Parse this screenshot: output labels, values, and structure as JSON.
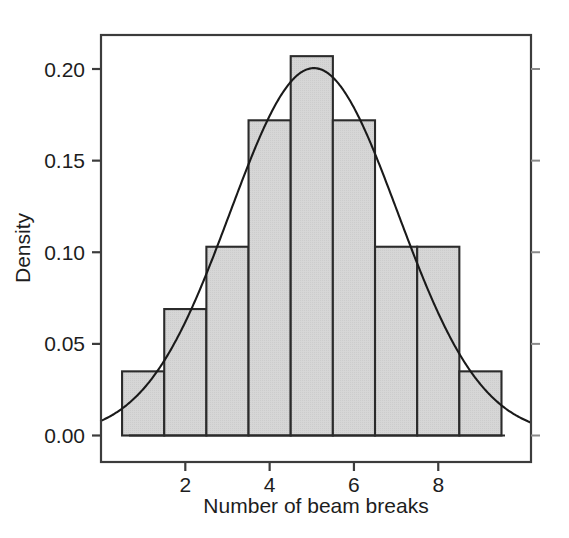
{
  "chart_data": {
    "type": "bar",
    "title": "",
    "subtitle": "",
    "xlabel": "Number of beam breaks",
    "ylabel": "Density",
    "grid": false,
    "legend": "none",
    "xlim": [
      0.0,
      10.2
    ],
    "ylim": [
      0.0,
      0.2175
    ],
    "xticks": [
      2,
      4,
      6,
      8
    ],
    "xtick_labels": [
      "2",
      "4",
      "6",
      "8"
    ],
    "yticks": [
      0.0,
      0.05,
      0.1,
      0.15,
      0.2
    ],
    "ytick_labels": [
      "0.00",
      "0.05",
      "0.10",
      "0.15",
      "0.20"
    ],
    "bin_edges": [
      0.5,
      1.5,
      2.5,
      3.5,
      4.5,
      5.5,
      6.5,
      7.5,
      8.5,
      9.5
    ],
    "bin_centers": [
      1,
      2,
      3,
      4,
      5,
      6,
      7,
      8,
      9
    ],
    "categories": [
      "0.5-1.5",
      "1.5-2.5",
      "2.5-3.5",
      "3.5-4.5",
      "4.5-5.5",
      "5.5-6.5",
      "6.5-7.5",
      "7.5-8.5",
      "8.5-9.5"
    ],
    "values": [
      0.035,
      0.069,
      0.103,
      0.172,
      0.207,
      0.172,
      0.103,
      0.103,
      0.035
    ],
    "bar_fill": "#d4d4d4",
    "bar_border": "#2b2b2b",
    "overlay": {
      "name": "normal density curve",
      "type": "line",
      "color": "#1a1a1a",
      "distribution": "normal",
      "mean": 5.05,
      "sd": 1.99,
      "peak_value": 0.2
    },
    "axes_box": true,
    "box_color": "#3c3c3c"
  }
}
